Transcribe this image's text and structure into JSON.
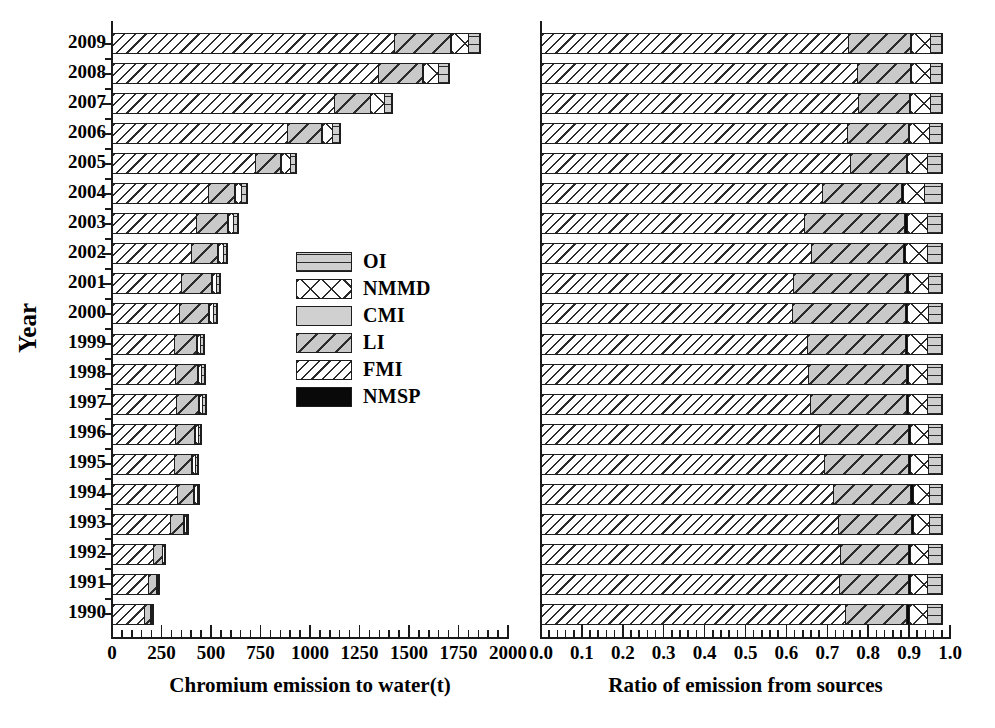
{
  "chart_data": {
    "type": "bar",
    "title": "",
    "orientation": "horizontal",
    "stacked": true,
    "panels": [
      {
        "id": "absolute",
        "xlabel": "Chromium emission to water(t)",
        "ylabel": "Year",
        "xlim": [
          0,
          2000
        ],
        "xticks": [
          0,
          250,
          500,
          750,
          1000,
          1250,
          1500,
          1750,
          2000
        ],
        "xticklabels": [
          "0",
          "250",
          "500",
          "750",
          "1000",
          "1250",
          "1500",
          "1750",
          "2000"
        ],
        "minor_ticks_per_interval": 5,
        "grid": false
      },
      {
        "id": "ratio",
        "xlabel": "Ratio of emission from sources",
        "ylabel": "",
        "xlim": [
          0,
          1
        ],
        "xticks": [
          0.0,
          0.1,
          0.2,
          0.3,
          0.4,
          0.5,
          0.6,
          0.7,
          0.8,
          0.9,
          1.0
        ],
        "xticklabels": [
          "0.0",
          "0.1",
          "0.2",
          "0.3",
          "0.4",
          "0.5",
          "0.6",
          "0.7",
          "0.8",
          "0.9",
          "1.0"
        ],
        "minor_ticks_per_interval": 5,
        "grid": false
      }
    ],
    "categories": [
      "2009",
      "2008",
      "2007",
      "2006",
      "2005",
      "2004",
      "2003",
      "2002",
      "2001",
      "2000",
      "1999",
      "1998",
      "1997",
      "1996",
      "1995",
      "1994",
      "1993",
      "1992",
      "1991",
      "1990"
    ],
    "legend": {
      "position": "center-left-inset",
      "entries": [
        {
          "name": "OI",
          "pattern": "horizontal-lines-gray"
        },
        {
          "name": "NMMD",
          "pattern": "cross-hatch-white"
        },
        {
          "name": "CMI",
          "pattern": "solid-light-gray"
        },
        {
          "name": "LI",
          "pattern": "wide-diagonal-hatch-gray"
        },
        {
          "name": "FMI",
          "pattern": "narrow-diagonal-hatch-white"
        },
        {
          "name": "NMSP",
          "pattern": "solid-black"
        }
      ]
    },
    "stack_order": [
      "FMI",
      "LI",
      "NMSP",
      "NMMD",
      "OI",
      "CMI"
    ],
    "series_absolute": [
      {
        "name": "FMI",
        "values": [
          1430,
          1350,
          1130,
          890,
          730,
          490,
          430,
          405,
          355,
          345,
          320,
          325,
          330,
          325,
          320,
          335,
          300,
          215,
          190,
          170
        ]
      },
      {
        "name": "LI",
        "values": [
          290,
          230,
          185,
          180,
          135,
          140,
          165,
          140,
          160,
          155,
          120,
          120,
          120,
          105,
          95,
          90,
          75,
          50,
          45,
          35
        ]
      },
      {
        "name": "NMSP",
        "values": [
          12,
          10,
          9,
          8,
          7,
          6,
          6,
          5,
          5,
          5,
          4,
          4,
          4,
          4,
          4,
          4,
          3,
          2,
          2,
          2
        ]
      },
      {
        "name": "NMMD",
        "values": [
          95,
          85,
          75,
          60,
          50,
          40,
          35,
          35,
          30,
          30,
          25,
          25,
          25,
          22,
          22,
          20,
          18,
          14,
          12,
          11
        ]
      },
      {
        "name": "OI",
        "values": [
          60,
          55,
          45,
          40,
          35,
          30,
          25,
          22,
          20,
          20,
          18,
          18,
          18,
          16,
          16,
          15,
          13,
          10,
          9,
          8
        ]
      },
      {
        "name": "CMI",
        "values": [
          8,
          7,
          6,
          5,
          5,
          4,
          4,
          4,
          3,
          3,
          3,
          3,
          3,
          3,
          3,
          3,
          2,
          2,
          2,
          2
        ]
      }
    ],
    "totals_absolute": [
      1895,
      1737,
      1450,
      1183,
      962,
      710,
      665,
      611,
      573,
      558,
      490,
      495,
      500,
      475,
      460,
      467,
      411,
      293,
      260,
      228
    ],
    "series_ratio": [
      {
        "name": "FMI",
        "values": [
          0.755,
          0.777,
          0.779,
          0.752,
          0.759,
          0.69,
          0.647,
          0.663,
          0.62,
          0.618,
          0.653,
          0.657,
          0.66,
          0.684,
          0.696,
          0.717,
          0.73,
          0.734,
          0.731,
          0.746
        ]
      },
      {
        "name": "LI",
        "values": [
          0.153,
          0.132,
          0.128,
          0.152,
          0.14,
          0.197,
          0.248,
          0.229,
          0.279,
          0.278,
          0.245,
          0.242,
          0.24,
          0.221,
          0.207,
          0.193,
          0.182,
          0.171,
          0.173,
          0.154
        ]
      },
      {
        "name": "NMSP",
        "values": [
          0.006,
          0.006,
          0.006,
          0.007,
          0.007,
          0.008,
          0.009,
          0.008,
          0.009,
          0.009,
          0.008,
          0.008,
          0.008,
          0.008,
          0.009,
          0.009,
          0.007,
          0.007,
          0.008,
          0.009
        ]
      },
      {
        "name": "NMMD",
        "values": [
          0.05,
          0.049,
          0.052,
          0.051,
          0.052,
          0.056,
          0.053,
          0.057,
          0.052,
          0.054,
          0.051,
          0.05,
          0.05,
          0.046,
          0.048,
          0.043,
          0.044,
          0.048,
          0.046,
          0.048
        ]
      },
      {
        "name": "OI",
        "values": [
          0.032,
          0.032,
          0.031,
          0.034,
          0.037,
          0.044,
          0.038,
          0.037,
          0.035,
          0.036,
          0.038,
          0.038,
          0.037,
          0.036,
          0.035,
          0.033,
          0.032,
          0.035,
          0.037,
          0.038
        ]
      },
      {
        "name": "CMI",
        "values": [
          0.004,
          0.004,
          0.004,
          0.004,
          0.005,
          0.005,
          0.005,
          0.006,
          0.005,
          0.005,
          0.005,
          0.005,
          0.005,
          0.005,
          0.005,
          0.005,
          0.005,
          0.005,
          0.005,
          0.005
        ]
      }
    ]
  },
  "colors": {
    "axis": "#1a1a1a",
    "outline": "#1d1d1d",
    "OI": "#cfcfcf",
    "NMMD": "#ffffff",
    "CMI": "#d0d0d0",
    "LI": "#c9c9c9",
    "FMI": "#ffffff",
    "NMSP": "#090909"
  }
}
